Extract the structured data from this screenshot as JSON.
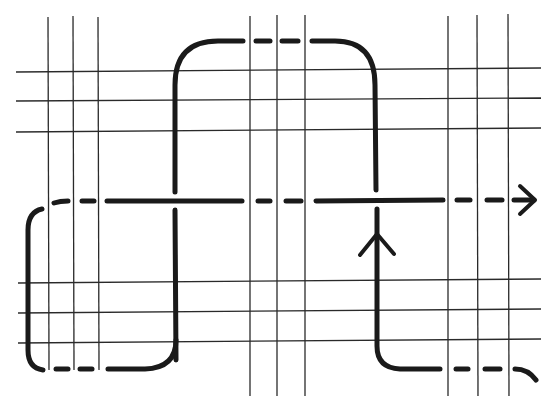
{
  "diagram": {
    "type": "knot-path-over-grid",
    "grid": {
      "vertical_groups": [
        {
          "name": "left",
          "x": [
            48,
            73,
            99
          ],
          "y_range": [
            17,
            370
          ]
        },
        {
          "name": "middle",
          "x": [
            250,
            277,
            305
          ],
          "y_range": [
            15,
            396
          ]
        },
        {
          "name": "right",
          "x": [
            448,
            477,
            508
          ],
          "y_range": [
            15,
            396
          ]
        }
      ],
      "horizontal_groups": [
        {
          "name": "top",
          "y": [
            71,
            101,
            132
          ],
          "x_range": [
            16,
            541
          ]
        },
        {
          "name": "bottom",
          "y": [
            282,
            313,
            343
          ],
          "x_range": [
            18,
            541
          ]
        }
      ]
    },
    "strand": {
      "color": "#1a1a1a",
      "arrows": [
        {
          "name": "right-arrowhead",
          "position": [
            526,
            201
          ],
          "direction": "right"
        },
        {
          "name": "up-arrowhead",
          "position": [
            377,
            232
          ],
          "direction": "up"
        }
      ]
    }
  }
}
